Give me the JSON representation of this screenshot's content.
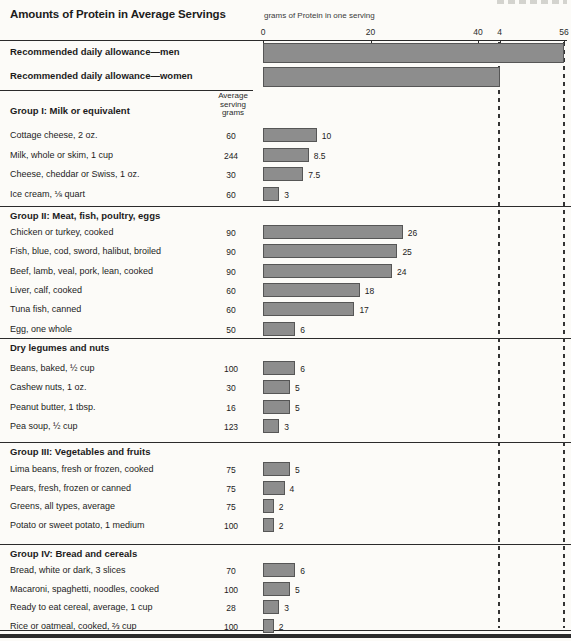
{
  "page": {
    "title": "Amounts of Protein in Average Servings",
    "axis_title": "grams of Protein in one serving",
    "column_header": [
      "Average",
      "serving",
      "grams"
    ]
  },
  "chart_data": {
    "type": "bar",
    "orientation": "horizontal",
    "title": "Amounts of Protein in Average Servings",
    "xlabel": "grams of Protein in one serving",
    "xlim": [
      0,
      56
    ],
    "axis_ticks": [
      {
        "label": "0",
        "value": 0
      },
      {
        "label": "20",
        "value": 20
      },
      {
        "label": "40",
        "value": 40
      },
      {
        "label": "4",
        "value": 44
      },
      {
        "label": "56",
        "value": 56
      }
    ],
    "reference_lines": [
      {
        "name": "rda-women-line",
        "value": 44,
        "style": "dashed"
      },
      {
        "name": "rda-men-line",
        "value": 56,
        "style": "dashed"
      }
    ],
    "rda": [
      {
        "label": "Recommended daily allowance—men",
        "value": 56
      },
      {
        "label": "Recommended daily allowance—women",
        "value": 44
      }
    ],
    "grams_column_header": "Average serving grams",
    "sections": [
      {
        "heading": "Group I: Milk or equivalent",
        "rows": [
          {
            "label": "Cottage cheese, 2 oz.",
            "grams": "60",
            "value": 10,
            "value_label": "10"
          },
          {
            "label": "Milk, whole or skim, 1 cup",
            "grams": "244",
            "value": 8.5,
            "value_label": "8.5"
          },
          {
            "label": "Cheese, cheddar or Swiss, 1 oz.",
            "grams": "30",
            "value": 7.5,
            "value_label": "7.5"
          },
          {
            "label": "Ice cream, ⅛ quart",
            "grams": "60",
            "value": 3,
            "value_label": "3"
          }
        ]
      },
      {
        "heading": "Group II: Meat, fish, poultry, eggs",
        "rows": [
          {
            "label": "Chicken or turkey, cooked",
            "grams": "90",
            "value": 26,
            "value_label": "26"
          },
          {
            "label": "Fish, blue, cod, sword, halibut, broiled",
            "grams": "90",
            "value": 25,
            "value_label": "25"
          },
          {
            "label": "Beef, lamb, veal, pork, lean, cooked",
            "grams": "90",
            "value": 24,
            "value_label": "24"
          },
          {
            "label": "Liver, calf, cooked",
            "grams": "60",
            "value": 18,
            "value_label": "18"
          },
          {
            "label": "Tuna fish, canned",
            "grams": "60",
            "value": 17,
            "value_label": "17"
          },
          {
            "label": "Egg, one whole",
            "grams": "50",
            "value": 6,
            "value_label": "6"
          }
        ]
      },
      {
        "heading": "Dry legumes and nuts",
        "rows": [
          {
            "label": "Beans, baked, ½ cup",
            "grams": "100",
            "value": 6,
            "value_label": "6"
          },
          {
            "label": "Cashew nuts, 1 oz.",
            "grams": "30",
            "value": 5,
            "value_label": "5"
          },
          {
            "label": "Peanut butter, 1 tbsp.",
            "grams": "16",
            "value": 5,
            "value_label": "5"
          },
          {
            "label": "Pea soup, ½ cup",
            "grams": "123",
            "value": 3,
            "value_label": "3"
          }
        ]
      },
      {
        "heading": "Group III: Vegetables and fruits",
        "rows": [
          {
            "label": "Lima beans, fresh or frozen, cooked",
            "grams": "75",
            "value": 5,
            "value_label": "5"
          },
          {
            "label": "Pears, fresh, frozen or canned",
            "grams": "75",
            "value": 4,
            "value_label": "4"
          },
          {
            "label": "Greens, all types, average",
            "grams": "75",
            "value": 2,
            "value_label": "2"
          },
          {
            "label": "Potato or sweet potato, 1 medium",
            "grams": "100",
            "value": 2,
            "value_label": "2"
          }
        ]
      },
      {
        "heading": "Group IV: Bread and cereals",
        "rows": [
          {
            "label": "Bread, white or dark, 3 slices",
            "grams": "70",
            "value": 6,
            "value_label": "6"
          },
          {
            "label": "Macaroni, spaghetti, noodles, cooked",
            "grams": "100",
            "value": 5,
            "value_label": "5"
          },
          {
            "label": "Ready to eat cereal, average, 1 cup",
            "grams": "28",
            "value": 3,
            "value_label": "3"
          },
          {
            "label": "Rice or oatmeal, cooked, ⅔ cup",
            "grams": "100",
            "value": 2,
            "value_label": "2"
          }
        ]
      }
    ],
    "colors": {
      "bar_fill": "#8d8d8d",
      "bar_border": "#565656",
      "rule": "#2b2b2b",
      "background": "#fcfbf8"
    }
  }
}
